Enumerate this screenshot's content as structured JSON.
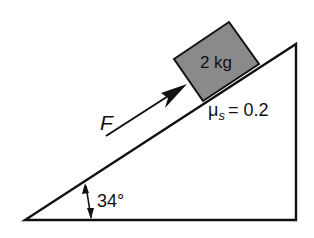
{
  "diagram": {
    "type": "inclined-plane-free-body",
    "block": {
      "label": "2 kg",
      "fill": "#8a8a8a"
    },
    "force": {
      "label": "F"
    },
    "friction": {
      "symbol": "μ",
      "subscript": "s",
      "equals": "= 0.2"
    },
    "incline": {
      "angle_label": "34°"
    },
    "colors": {
      "line": "#111111",
      "block": "#8a8a8a",
      "background": "#ffffff"
    }
  }
}
